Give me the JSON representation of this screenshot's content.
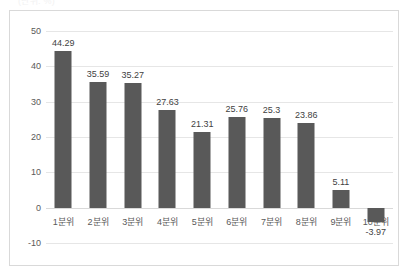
{
  "top_caption": {
    "text": "(단위: %)"
  },
  "chart_data": {
    "type": "bar",
    "title": "",
    "subtitle": "",
    "xlabel": "",
    "ylabel": "",
    "categories": [
      "1분위",
      "2분위",
      "3분위",
      "4분위",
      "5분위",
      "6분위",
      "7분위",
      "8분위",
      "9분위",
      "10분위"
    ],
    "values": [
      44.29,
      35.59,
      35.27,
      27.63,
      21.31,
      25.76,
      25.3,
      23.86,
      5.11,
      -3.97
    ],
    "value_labels": [
      "44.29",
      "35.59",
      "35.27",
      "27.63",
      "21.31",
      "25.76",
      "25.3",
      "23.86",
      "5.11",
      "-3.97"
    ],
    "ylim": [
      -10,
      50
    ],
    "yticks": [
      50,
      40,
      30,
      20,
      10,
      0,
      -10
    ],
    "ytick_labels": [
      "50",
      "40",
      "30",
      "20",
      "10",
      "0",
      "-10"
    ],
    "grid": true,
    "legend": false,
    "legend_position": "none",
    "series": [
      {
        "name": "",
        "values": [
          44.29,
          35.59,
          35.27,
          27.63,
          21.31,
          25.76,
          25.3,
          23.86,
          5.11,
          -3.97
        ]
      }
    ],
    "colors": {
      "bar": "#595959",
      "gridline": "#e6e6e6",
      "axis_text": "#595959",
      "label_text": "#3f3f3f",
      "frame": "#d9d9d9",
      "background": "#ffffff"
    }
  }
}
